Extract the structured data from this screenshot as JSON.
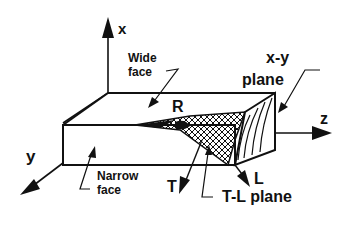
{
  "diagram": {
    "axes": {
      "x_label": "x",
      "y_label": "y",
      "z_label": "z"
    },
    "directions": {
      "R_label": "R",
      "T_label": "T",
      "L_label": "L"
    },
    "annotations": {
      "wide_face_line1": "Wide",
      "wide_face_line2": "face",
      "narrow_face_line1": "Narrow",
      "narrow_face_line2": "face",
      "xy_plane_line1": "x-y",
      "xy_plane_line2": "plane",
      "tl_plane": "T-L  plane"
    },
    "colors": {
      "ink": "#111111",
      "background": "#ffffff"
    }
  }
}
